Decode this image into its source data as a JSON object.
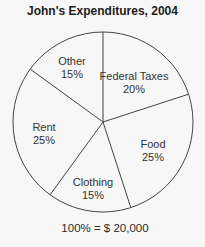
{
  "chart_data": {
    "type": "pie",
    "title": "John's Expenditures, 2004",
    "caption": "100% = $ 20,000",
    "total": 20000,
    "start_angle_deg": 0,
    "direction": "clockwise",
    "slices": [
      {
        "label": "Federal Taxes",
        "value": 20,
        "value_label": "20%"
      },
      {
        "label": "Food",
        "value": 25,
        "value_label": "25%"
      },
      {
        "label": "Clothing",
        "value": 15,
        "value_label": "15%"
      },
      {
        "label": "Rent",
        "value": 25,
        "value_label": "25%"
      },
      {
        "label": "Other",
        "value": 15,
        "value_label": "15%"
      }
    ],
    "colors": {
      "fill": "#f7f7f7",
      "stroke": "#444444",
      "text": "#2a2a2a"
    }
  }
}
